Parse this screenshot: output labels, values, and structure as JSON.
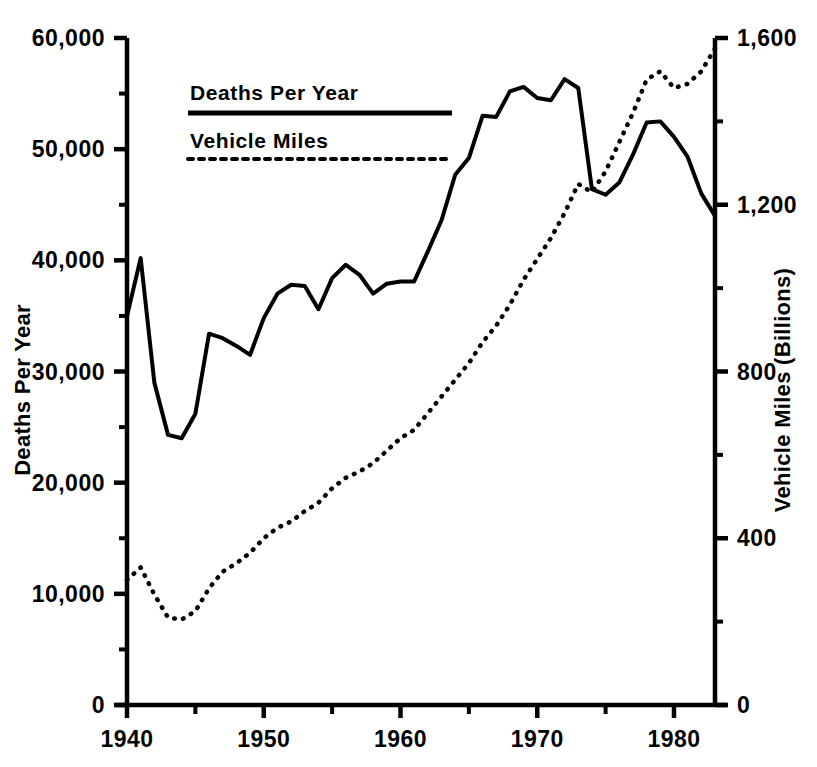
{
  "chart_data": {
    "type": "line",
    "title": "",
    "subtitle": "",
    "xlabel": "",
    "ylabel": "Deaths Per Year",
    "y2label": "Vehicle Miles (Billions)",
    "grid": false,
    "legend_position": "top-left",
    "xlim": [
      1940,
      1983
    ],
    "ylim": [
      0,
      60000
    ],
    "y2lim": [
      0,
      1600
    ],
    "x_ticks": [
      1940,
      1950,
      1960,
      1970,
      1980
    ],
    "x_tick_labels": [
      "1940",
      "1950",
      "1960",
      "1970",
      "1980"
    ],
    "x_minor_ticks": [
      1945,
      1955,
      1965,
      1975
    ],
    "y_ticks": [
      0,
      10000,
      20000,
      30000,
      40000,
      50000,
      60000
    ],
    "y_tick_labels": [
      "0",
      "10,000",
      "20,000",
      "30,000",
      "40,000",
      "50,000",
      "60,000"
    ],
    "y_minor_ticks": [
      5000,
      15000,
      25000,
      35000,
      45000,
      55000
    ],
    "y2_ticks": [
      0,
      400,
      800,
      1200,
      1600
    ],
    "y2_tick_labels": [
      "0",
      "400",
      "800",
      "1,200",
      "1,600"
    ],
    "y2_minor_ticks": [
      200,
      600,
      1000,
      1400
    ],
    "legend": [
      {
        "name": "Deaths Per Year",
        "style": "solid",
        "color": "#000000"
      },
      {
        "name": "Vehicle Miles",
        "style": "dotted",
        "color": "#000000"
      }
    ],
    "x": [
      1940,
      1941,
      1942,
      1943,
      1944,
      1945,
      1946,
      1947,
      1948,
      1949,
      1950,
      1951,
      1952,
      1953,
      1954,
      1955,
      1956,
      1957,
      1958,
      1959,
      1960,
      1961,
      1962,
      1963,
      1964,
      1965,
      1966,
      1967,
      1968,
      1969,
      1970,
      1971,
      1972,
      1973,
      1974,
      1975,
      1976,
      1977,
      1978,
      1979,
      1980,
      1981,
      1982,
      1983
    ],
    "series": [
      {
        "name": "Deaths Per Year",
        "axis": "left",
        "style": "solid",
        "units": "deaths",
        "values": [
          35000,
          40200,
          29000,
          24300,
          24000,
          26200,
          33400,
          33000,
          32300,
          31500,
          34800,
          37000,
          37800,
          37700,
          35600,
          38400,
          39600,
          38700,
          37000,
          37900,
          38100,
          38100,
          40800,
          43600,
          47700,
          49200,
          53000,
          52900,
          55200,
          55600,
          54600,
          54400,
          56300,
          55500,
          46400,
          45900,
          47000,
          49500,
          52400,
          52500,
          51100,
          49300,
          46000,
          44000
        ]
      },
      {
        "name": "Vehicle Miles",
        "axis": "right",
        "style": "dotted",
        "units": "billions of miles",
        "values": [
          300,
          330,
          265,
          210,
          205,
          225,
          280,
          320,
          340,
          365,
          400,
          425,
          440,
          465,
          485,
          520,
          545,
          560,
          580,
          610,
          640,
          660,
          700,
          740,
          780,
          820,
          870,
          910,
          960,
          1020,
          1070,
          1120,
          1180,
          1250,
          1230,
          1280,
          1350,
          1420,
          1500,
          1520,
          1480,
          1490,
          1520,
          1575
        ]
      }
    ]
  },
  "legend_box": {
    "entry1": "Deaths Per Year",
    "entry2": "Vehicle Miles"
  }
}
